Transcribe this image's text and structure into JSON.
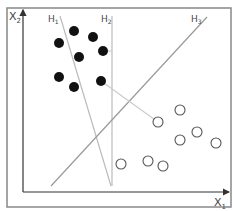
{
  "diagram": {
    "frame": {
      "x": 7,
      "y": 8,
      "width": 224,
      "height": 199,
      "stroke": "#888888"
    },
    "axes": {
      "origin": [
        23,
        192
      ],
      "y_axis_top": [
        23,
        10
      ],
      "x_axis_right": [
        229,
        192
      ],
      "x_label": {
        "text": "X",
        "sub": "1",
        "x": 214,
        "y": 206
      },
      "y_label": {
        "text": "X",
        "sub": "2",
        "x": 9,
        "y": 20
      }
    },
    "hyperplanes": [
      {
        "name": "H1",
        "label": "H",
        "sub": "1",
        "label_x": 48,
        "label_y": 22,
        "x1": 60,
        "y1": 16,
        "x2": 111,
        "y2": 186,
        "stroke": "#bbbbbb"
      },
      {
        "name": "H2",
        "label": "H",
        "sub": "2",
        "label_x": 101,
        "label_y": 22,
        "x1": 112,
        "y1": 16,
        "x2": 112,
        "y2": 186,
        "stroke": "#bbbbbb"
      },
      {
        "name": "H3",
        "label": "H",
        "sub": "3",
        "label_x": 191,
        "label_y": 22,
        "x1": 207,
        "y1": 17,
        "x2": 51,
        "y2": 186,
        "stroke": "#999999"
      }
    ],
    "connectors": [
      {
        "x1": 101,
        "y1": 81,
        "x2": 158,
        "y2": 122,
        "stroke": "#cccccc"
      },
      {
        "x1": 103,
        "y1": 51,
        "x2": 112,
        "y2": 51,
        "stroke": "#cccccc"
      }
    ],
    "class_filled": {
      "color": "#111111",
      "radius": 5,
      "points": [
        [
          74,
          31
        ],
        [
          93,
          37
        ],
        [
          59,
          43
        ],
        [
          103,
          51
        ],
        [
          79,
          57
        ],
        [
          59,
          77
        ],
        [
          74,
          87
        ],
        [
          101,
          81
        ]
      ]
    },
    "class_open": {
      "stroke": "#555555",
      "radius": 5,
      "points": [
        [
          158,
          122
        ],
        [
          180,
          110
        ],
        [
          180,
          140
        ],
        [
          197,
          132
        ],
        [
          216,
          143
        ],
        [
          121,
          164
        ],
        [
          148,
          161
        ],
        [
          163,
          166
        ]
      ]
    }
  }
}
